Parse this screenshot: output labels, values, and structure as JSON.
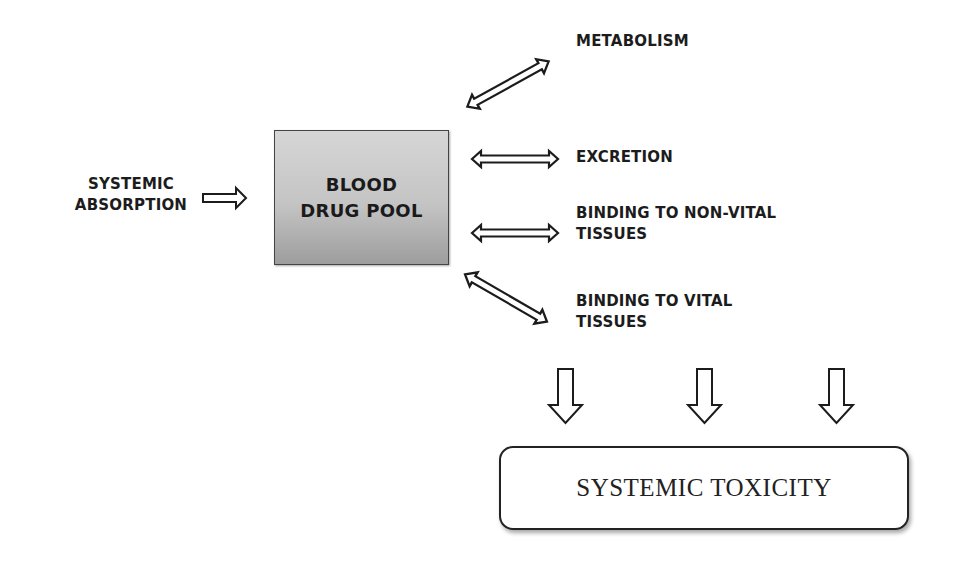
{
  "diagram": {
    "source": {
      "line1": "SYSTEMIC",
      "line2": "ABSORPTION"
    },
    "central_node": {
      "line1": "BLOOD",
      "line2": "DRUG POOL"
    },
    "outcomes": [
      {
        "id": "metabolism",
        "line1": "METABOLISM",
        "line2": "",
        "arrow": "bidirectional-diagonal-up"
      },
      {
        "id": "excretion",
        "line1": "EXCRETION",
        "line2": "",
        "arrow": "bidirectional-horizontal"
      },
      {
        "id": "non-vital",
        "line1": "BINDING TO NON-VITAL",
        "line2": "TISSUES",
        "arrow": "bidirectional-horizontal"
      },
      {
        "id": "vital",
        "line1": "BINDING TO VITAL",
        "line2": "TISSUES",
        "arrow": "bidirectional-diagonal-down"
      }
    ],
    "result": {
      "label": "SYSTEMIC TOXICITY",
      "incoming_arrows": 3
    }
  },
  "colors": {
    "text": "#1c1c1c",
    "node_fill_top": "#d6d6d6",
    "node_fill_bottom": "#9d9d9d",
    "outline": "#222222",
    "background": "#ffffff"
  }
}
